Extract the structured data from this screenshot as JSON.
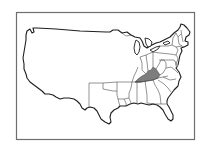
{
  "map": {
    "subject": "United States",
    "highlighted_state": "Kentucky",
    "colors": {
      "highlight_fill": "#7d7d7d",
      "outline": "#1e1e1e",
      "state_border": "#3a3a3a",
      "frame": "#6e6e6e",
      "background": "#ffffff"
    }
  }
}
